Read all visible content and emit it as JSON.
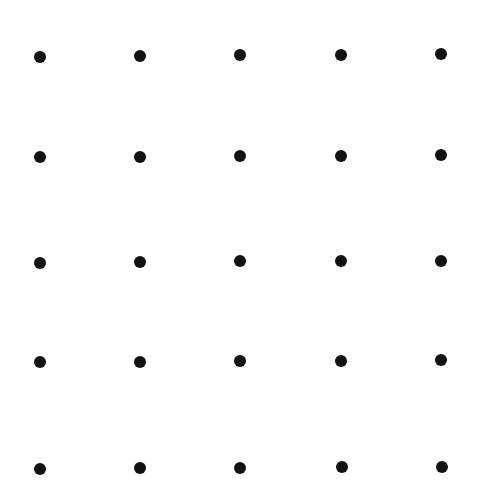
{
  "diagram": {
    "type": "dot-grid",
    "rows": 5,
    "cols": 5,
    "dot_color": "#111111",
    "background": "#ffffff",
    "dot_diameter": 12,
    "dots": [
      [
        [
          40,
          57
        ],
        [
          140,
          56
        ],
        [
          240,
          55
        ],
        [
          341,
          55
        ],
        [
          441,
          54
        ]
      ],
      [
        [
          40,
          157
        ],
        [
          140,
          157
        ],
        [
          240,
          156
        ],
        [
          341,
          156
        ],
        [
          441,
          155
        ]
      ],
      [
        [
          40,
          263
        ],
        [
          140,
          262
        ],
        [
          240,
          261
        ],
        [
          341,
          261
        ],
        [
          441,
          261
        ]
      ],
      [
        [
          40,
          362
        ],
        [
          140,
          362
        ],
        [
          240,
          361
        ],
        [
          341,
          361
        ],
        [
          441,
          360
        ]
      ],
      [
        [
          40,
          469
        ],
        [
          140,
          468
        ],
        [
          240,
          468
        ],
        [
          342,
          467
        ],
        [
          442,
          467
        ]
      ]
    ]
  }
}
